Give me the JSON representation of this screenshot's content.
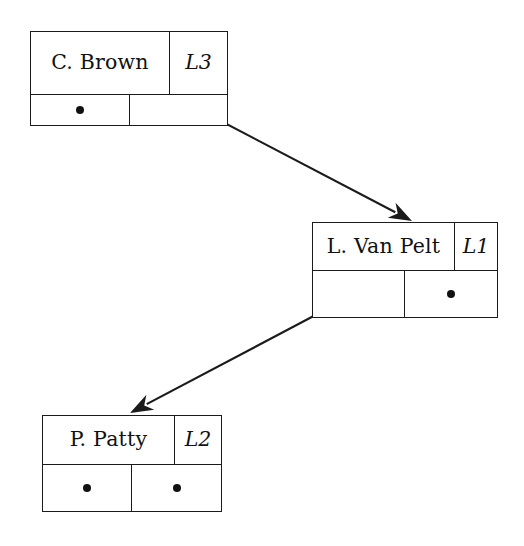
{
  "diagram": {
    "type": "record-pointer-diagram",
    "stroke_color": "#1b1b1b",
    "background_color": "#ffffff",
    "dot_color": "#111111",
    "records": [
      {
        "id": "c-brown",
        "name": "C. Brown",
        "label": "L3",
        "pointer_left": "dot",
        "pointer_right": "link",
        "x": 30,
        "y": 31,
        "width": 198,
        "height": 95,
        "name_width": 140,
        "bottom_split": 100,
        "row_split": 64
      },
      {
        "id": "l-van-pelt",
        "name": "L. Van Pelt",
        "label": "L1",
        "pointer_left": "link",
        "pointer_right": "dot",
        "x": 312,
        "y": 222,
        "width": 186,
        "height": 96,
        "name_width": 143,
        "bottom_split": 93,
        "row_split": 49
      },
      {
        "id": "p-patty",
        "name": "P. Patty",
        "label": "L2",
        "pointer_left": "dot",
        "pointer_right": "dot",
        "x": 42,
        "y": 415,
        "width": 180,
        "height": 97,
        "name_width": 133,
        "bottom_split": 90,
        "row_split": 50
      }
    ],
    "arrows": [
      {
        "id": "arrow-brown-to-vanpelt",
        "from_record": "c-brown",
        "to_record": "l-van-pelt",
        "from_label": "C. Brown right pointer",
        "to_label": "L. Van Pelt top edge",
        "x1": 175,
        "y1": 97,
        "x2": 412,
        "y2": 221
      },
      {
        "id": "arrow-vanpelt-to-patty",
        "from_record": "l-van-pelt",
        "to_record": "p-patty",
        "from_label": "L. Van Pelt left pointer",
        "to_label": "P. Patty top edge",
        "x1": 361,
        "y1": 291,
        "x2": 130,
        "y2": 413
      }
    ],
    "dot_glyph": "●"
  }
}
